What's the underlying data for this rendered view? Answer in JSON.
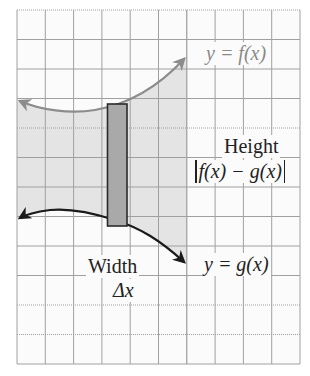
{
  "figure": {
    "type": "area-between-curves",
    "grid": {
      "columns": 10,
      "rows": 12,
      "left": 17,
      "top": 10,
      "right": 300,
      "bottom": 364
    },
    "colors": {
      "background": "#fbfbfb",
      "grid_line": "#9a9a9a",
      "shaded_region": "#e4e4e4",
      "f_curve": "#8c8c8c",
      "g_curve": "#1a1a1a",
      "rectangle_fill": "#a9a9a9",
      "rectangle_stroke": "#2a2a2a"
    }
  },
  "labels": {
    "f_curve": "y = f(x)",
    "g_curve": "y = g(x)",
    "height_title": "Height",
    "height_expression": "f(x) − g(x)",
    "width_title": "Width",
    "width_expression": "Δx"
  }
}
